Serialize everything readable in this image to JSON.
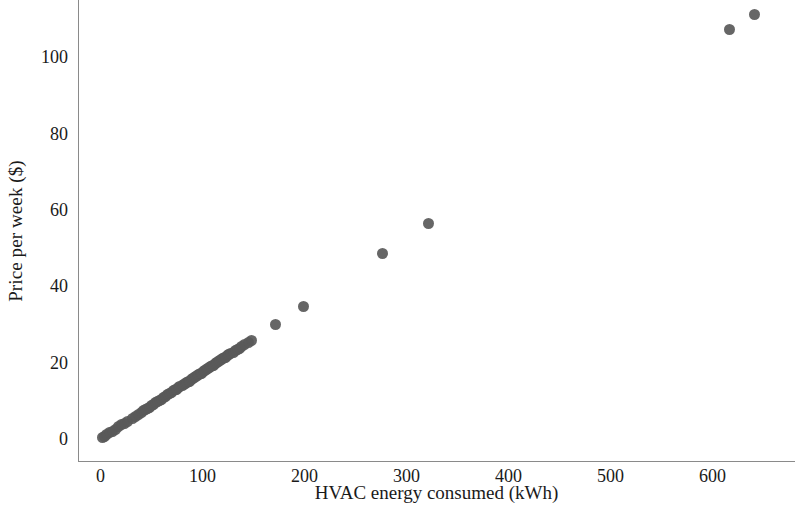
{
  "chart": {
    "type": "scatter",
    "title": "",
    "xlabel": "HVAC energy consumed (kWh)",
    "ylabel": "Price per week ($)",
    "marker_color": "#595959",
    "axis_color": "#8a8a8a",
    "background": "#ffffff"
  },
  "chart_data": {
    "type": "scatter",
    "title": "",
    "xlabel": "HVAC energy consumed (kWh)",
    "ylabel": "Price per week ($)",
    "xlim": [
      -22,
      681
    ],
    "ylim": [
      -6,
      115
    ],
    "xticks": [
      0,
      100,
      200,
      300,
      400,
      500,
      600
    ],
    "xticklabels": [
      "0",
      "100",
      "200",
      "300",
      "400",
      "500",
      "600"
    ],
    "yticks": [
      0,
      20,
      40,
      60,
      80,
      100
    ],
    "yticklabels": [
      "0",
      "20",
      "40",
      "60",
      "80",
      "100"
    ],
    "grid": false,
    "legend": null,
    "marker_color": "#595959",
    "marker_size": 11,
    "series": [
      {
        "name": "listings",
        "x": [
          2,
          4,
          6,
          9,
          12,
          15,
          18,
          21,
          24,
          27,
          31,
          34,
          37,
          40,
          42,
          44,
          46,
          48,
          50,
          52,
          54,
          56,
          58,
          60,
          62,
          64,
          66,
          68,
          70,
          72,
          74,
          75,
          77,
          78,
          80,
          81,
          83,
          84,
          86,
          87,
          89,
          90,
          92,
          93,
          95,
          96,
          98,
          99,
          101,
          102,
          104,
          105,
          107,
          108,
          110,
          111,
          113,
          114,
          116,
          117,
          119,
          120,
          122,
          123,
          125,
          126,
          128,
          130,
          132,
          134,
          136,
          138,
          141,
          145,
          148,
          172,
          199,
          277,
          322,
          617,
          641
        ],
        "y": [
          0.4,
          0.8,
          1.1,
          1.6,
          2.1,
          2.6,
          3.2,
          3.7,
          4.2,
          4.7,
          5.4,
          6.0,
          6.5,
          7.0,
          7.4,
          7.7,
          8.1,
          8.4,
          8.8,
          9.1,
          9.5,
          9.8,
          10.2,
          10.5,
          10.9,
          11.2,
          11.6,
          11.9,
          12.3,
          12.6,
          13.0,
          13.1,
          13.5,
          13.7,
          14.0,
          14.2,
          14.5,
          14.7,
          15.1,
          15.2,
          15.6,
          15.8,
          16.1,
          16.3,
          16.6,
          16.8,
          17.2,
          17.3,
          17.7,
          17.9,
          18.2,
          18.4,
          18.7,
          18.9,
          19.3,
          19.4,
          19.8,
          20.0,
          20.3,
          20.5,
          20.8,
          21.0,
          21.4,
          21.5,
          21.9,
          22.1,
          22.4,
          22.8,
          23.1,
          23.5,
          23.8,
          24.2,
          24.7,
          25.4,
          25.9,
          30.1,
          34.8,
          48.6,
          56.4,
          107.2,
          111.3
        ]
      }
    ]
  }
}
